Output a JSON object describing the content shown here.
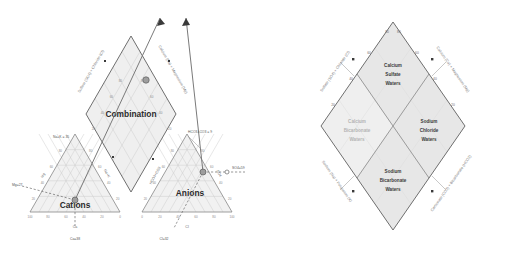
{
  "figure": {
    "type": "piper-trilinear-diagram",
    "panels": [
      {
        "id": "sample-plot",
        "role": "piper diagram with plotted sample and projection construction lines",
        "titles": {
          "cations": "Cations",
          "anions": "Anions",
          "combination": "Combination"
        },
        "cation_triangle": {
          "bottom_axis_label": "Ca",
          "bottom_ticks": [
            "100",
            "80",
            "60",
            "40",
            "20",
            "0"
          ],
          "left_axis_label": "Mg",
          "right_axis_label": "Na+K",
          "tick_values": [
            "20",
            "40",
            "60",
            "80",
            "100"
          ]
        },
        "anion_triangle": {
          "bottom_axis_label": "Cl",
          "bottom_ticks": [
            "0",
            "20",
            "40",
            "60",
            "80",
            "100"
          ],
          "left_axis_label": "HCO3+CO3",
          "right_axis_label": "SO4",
          "tick_values": [
            "20",
            "40",
            "60",
            "80",
            "100"
          ]
        },
        "diamond": {
          "left_axis_label": "Sulfate (SO4) + Chloride (Cl)",
          "right_axis_label": "Calcium (Ca) + Magnesium (Mg)",
          "ticks": [
            "20",
            "40",
            "60",
            "80"
          ]
        },
        "annotations": [
          {
            "name": "na-k-value",
            "text": "Na+K = 35"
          },
          {
            "name": "mg-value",
            "text": "Mg=27"
          },
          {
            "name": "ca-value",
            "text": "Ca=38"
          },
          {
            "name": "hco3-co3-value",
            "text": "HCO3+CO3 = 9"
          },
          {
            "name": "so4-value",
            "text": "SO4=59"
          },
          {
            "name": "cl-value",
            "text": "Cl=32"
          }
        ],
        "sample_values": {
          "Ca": 38,
          "Mg": 27,
          "NaK": 35,
          "Cl": 32,
          "SO4": 59,
          "HCO3CO3": 9
        }
      },
      {
        "id": "water-type-key",
        "role": "hydrochemical facies classification diamond",
        "axis_labels": {
          "upper_left": "Sulfate (SO4) + Chloride (Cl)",
          "upper_right": "Calcium (Ca) + Magnesium (Mg)",
          "lower_left": "Sodium (Na) + Potassium (K)",
          "lower_right": "Carbonate (CO3) + Bicarbonate (HCO3)"
        },
        "ticks": [
          "20",
          "40",
          "60",
          "80"
        ],
        "zones": [
          {
            "name": "calcium-sulfate-waters",
            "lines": [
              "Calcium",
              "Sulfate",
              "Waters"
            ],
            "muted": false
          },
          {
            "name": "calcium-bicarbonate-waters",
            "lines": [
              "Calcium",
              "Bicarbonate",
              "Waters"
            ],
            "muted": true
          },
          {
            "name": "sodium-chloride-waters",
            "lines": [
              "Sodium",
              "Chloride",
              "Waters"
            ],
            "muted": false
          },
          {
            "name": "sodium-bicarbonate-waters",
            "lines": [
              "Sodium",
              "Bicarbonate",
              "Waters"
            ],
            "muted": false
          }
        ]
      }
    ],
    "colors": {
      "background": "#ffffff",
      "fill": "#ececec",
      "grid": "#c9c9c9",
      "outline": "#8e8e8e",
      "text": "#4a4a4a",
      "title": "#2b2b2b",
      "muted_text": "#b4b4b4"
    }
  }
}
